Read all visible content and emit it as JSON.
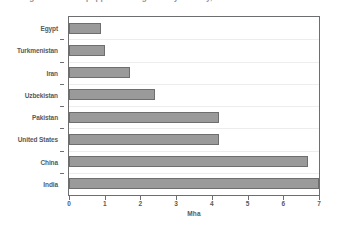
{
  "title": {
    "text": "Figure 1. Area equipped for irrigation by country, 2012",
    "cropped": true
  },
  "chart_data": {
    "type": "bar",
    "orientation": "horizontal",
    "title": "Figure 1. Area equipped for irrigation by country, 2012",
    "categories": [
      "Egypt",
      "Turkmenistan",
      "Iran",
      "Uzbekistan",
      "Pakistan",
      "United States",
      "China",
      "India"
    ],
    "values": [
      0.9,
      1.0,
      1.7,
      2.4,
      4.2,
      4.2,
      6.7,
      7.0
    ],
    "xlabel": "Mha",
    "ylabel": "",
    "xlim": [
      0,
      7
    ],
    "xticks": [
      0,
      1,
      2,
      3,
      4,
      5,
      6,
      7
    ],
    "xticklabels": [
      "0",
      "1",
      "2",
      "3",
      "4",
      "5",
      "6",
      "7"
    ],
    "grid": true,
    "grid_axis": "y",
    "legend": null,
    "bar_color": "#9a9a9a",
    "bar_border_color": "#6e6e6e",
    "axis_color": "#6d6e71",
    "gridline_color": "#ededed",
    "text_color": "#58595b"
  }
}
